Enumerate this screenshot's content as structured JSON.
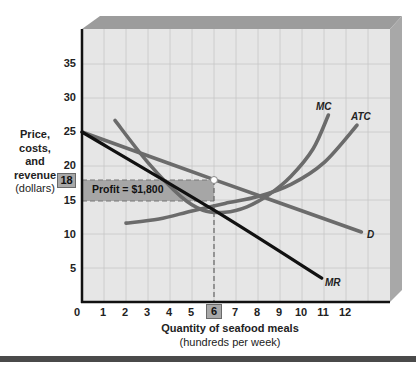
{
  "chart_data": {
    "type": "line",
    "title": "",
    "xlabel": "Quantity of seafood meals",
    "xlabel_sub": "(hundreds per week)",
    "ylabel_lines": [
      "Price,",
      "costs,",
      "and",
      "revenue"
    ],
    "ylabel_sub": "(dollars)",
    "xlim": [
      0,
      14
    ],
    "ylim": [
      0,
      40
    ],
    "x_ticks": [
      0,
      1,
      2,
      3,
      4,
      5,
      6,
      7,
      8,
      9,
      10,
      11,
      12
    ],
    "y_ticks": [
      5,
      10,
      15,
      20,
      25,
      30,
      35
    ],
    "highlighted_x_tick": 6,
    "highlighted_y_tick": 18,
    "grid": true,
    "series": [
      {
        "name": "D",
        "style": "gray-thick",
        "points": [
          [
            0,
            25
          ],
          [
            6,
            18
          ],
          [
            12.7,
            10.3
          ]
        ]
      },
      {
        "name": "MR",
        "style": "black-thick",
        "points": [
          [
            0,
            25
          ],
          [
            6,
            13.5
          ],
          [
            10.9,
            3.5
          ]
        ]
      },
      {
        "name": "MC",
        "style": "gray-thick",
        "points": [
          [
            1.5,
            26.7
          ],
          [
            3,
            20.5
          ],
          [
            4.5,
            15.5
          ],
          [
            5.5,
            13.5
          ],
          [
            6.5,
            13.2
          ],
          [
            7.5,
            14
          ],
          [
            8.5,
            15.8
          ],
          [
            9.5,
            18.5
          ],
          [
            10.5,
            22.5
          ],
          [
            11.2,
            27.5
          ]
        ]
      },
      {
        "name": "ATC",
        "style": "gray-thick",
        "points": [
          [
            2,
            11.6
          ],
          [
            3.5,
            12.2
          ],
          [
            5,
            13.4
          ],
          [
            6.5,
            14.5
          ],
          [
            8,
            15.5
          ],
          [
            9.5,
            17.3
          ],
          [
            11,
            20.5
          ],
          [
            12.5,
            26
          ]
        ]
      }
    ],
    "annotations": [
      {
        "type": "profit-rectangle",
        "label": "Profit = $1,800",
        "x0": 0,
        "x1": 6,
        "y0": 15,
        "y1": 18
      },
      {
        "type": "point",
        "x": 6,
        "y": 18
      },
      {
        "type": "dashed-vertical",
        "x": 6,
        "from_y": 0,
        "to_y": 18
      }
    ]
  },
  "labels": {
    "profit": "Profit = $1,800",
    "D": "D",
    "MR": "MR",
    "MC": "MC",
    "ATC": "ATC",
    "ylabel_1": "Price,",
    "ylabel_2": "costs,",
    "ylabel_3": "and",
    "ylabel_4": "revenue",
    "ylabel_sub": "(dollars)",
    "xlabel": "Quantity of seafood meals",
    "xlabel_sub": "(hundreds per week)",
    "y_tick_5": "5",
    "y_tick_10": "10",
    "y_tick_15": "15",
    "y_tick_18": "18",
    "y_tick_20": "20",
    "y_tick_25": "25",
    "y_tick_30": "30",
    "y_tick_35": "35",
    "x_tick_0": "0",
    "x_tick_1": "1",
    "x_tick_2": "2",
    "x_tick_3": "3",
    "x_tick_4": "4",
    "x_tick_5": "5",
    "x_tick_6": "6",
    "x_tick_7": "7",
    "x_tick_8": "8",
    "x_tick_9": "9",
    "x_tick_10": "10",
    "x_tick_11": "11",
    "x_tick_12": "12"
  },
  "colors": {
    "plot_bg": "#e4e4e4",
    "grid": "#c4c4c4",
    "frame_top": "#9a9a9a",
    "frame_side": "#a8a8a8",
    "curve_gray": "#6b6b6b",
    "curve_black": "#111111",
    "profit_fill": "#a4a4a4"
  }
}
